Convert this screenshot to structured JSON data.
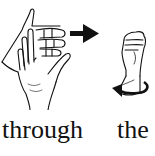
{
  "figure": {
    "signs": [
      {
        "word": "through",
        "description": "Right hand fingers slide between fingers of the left hand, arrow pointing right",
        "icons": [
          "hand-icon",
          "hand-icon",
          "arrow-right-icon"
        ]
      },
      {
        "word": "the",
        "description": "Fist with rotation arrow",
        "icons": [
          "fist-icon",
          "rotation-arrow-icon"
        ]
      }
    ],
    "colors": {
      "ink": "#111111",
      "background": "#ffffff"
    }
  }
}
